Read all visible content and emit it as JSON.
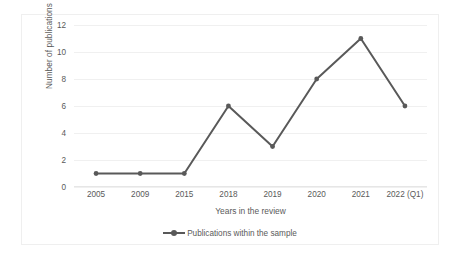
{
  "chart_data": {
    "type": "line",
    "title": "",
    "xlabel": "Years in the review",
    "ylabel": "Number of publications",
    "categories": [
      "2005",
      "2009",
      "2015",
      "2018",
      "2019",
      "2020",
      "2021",
      "2022 (Q1)"
    ],
    "series": [
      {
        "name": "Publications within the sample",
        "values": [
          1,
          1,
          1,
          6,
          3,
          8,
          11,
          6
        ]
      }
    ],
    "ylim": [
      0,
      12
    ],
    "ytick_labels": [
      "0",
      "2",
      "4",
      "6",
      "8",
      "10",
      "12"
    ],
    "ytick_values": [
      0,
      2,
      4,
      6,
      8,
      10,
      12
    ],
    "grid": true,
    "legend_position": "bottom",
    "colors": {
      "series_line": "#595959",
      "series_marker": "#595959",
      "gridline": "#f0f0f0",
      "axis_line": "#e6e6e6",
      "text": "#5a5a5a",
      "plot_border": "#efefef",
      "background": "#ffffff"
    }
  },
  "legend": {
    "items": [
      {
        "label": "Publications within the sample",
        "marker": "line-marker-icon"
      }
    ]
  }
}
